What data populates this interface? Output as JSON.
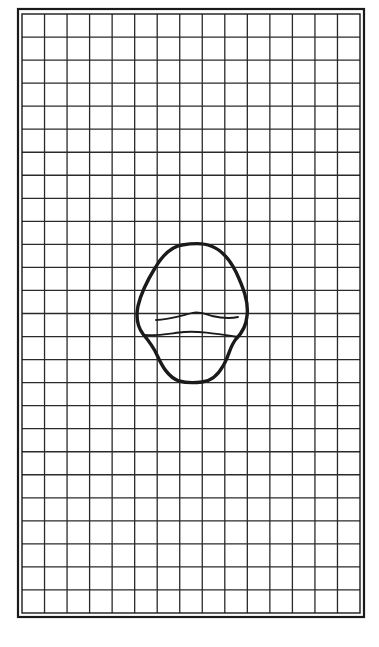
{
  "figure": {
    "background": "#ffffff",
    "ink_color": "#1a1a1a",
    "outer_frame": {
      "x": 18,
      "y": 9,
      "width": 346,
      "height": 608,
      "stroke_width": 2.2
    },
    "inner_frame": {
      "x": 22,
      "y": 14,
      "width": 338,
      "height": 599,
      "stroke_width": 1.4
    },
    "grid": {
      "columns": 15,
      "rows": 26,
      "line_width": 1.3,
      "line_color": "#2a2a2a"
    },
    "shape": {
      "label": "",
      "outline_width": 3.4,
      "inner_line_width": 1.8,
      "outline_path": "M 182 245 C 194 243, 204 243, 211 246 C 222 250, 230 260, 236 272 C 243 287, 249 302, 247 316 C 246 328, 240 335, 236 339 C 230 346, 229 356, 223 366 C 218 375, 212 381, 202 382 C 194 383, 186 383, 179 381 C 168 377, 162 366, 157 355 C 153 346, 148 340, 143 334 C 137 326, 136 316, 138 306 C 141 293, 147 281, 155 268 C 162 256, 170 247, 182 245 Z",
      "inner_upper_path": "M 156 320 C 168 320, 180 316, 192 313 C 200 311, 206 314, 212 316 C 221 318, 229 319, 238 317",
      "inner_lower_path": "M 143 335 C 160 336, 172 333, 184 332 C 198 331, 212 333, 238 337"
    }
  }
}
